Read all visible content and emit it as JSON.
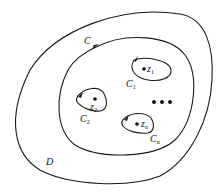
{
  "diagram": {
    "title": "",
    "region_label": "D",
    "outer_contour_label": "C",
    "inner_contours": [
      {
        "label": "C",
        "sub": "1",
        "point_label": "z",
        "point_sub": "1"
      },
      {
        "label": "C",
        "sub": "2",
        "point_label": "z",
        "point_sub": "2"
      },
      {
        "label": "C",
        "sub": "n",
        "point_label": "z",
        "point_sub": "n"
      }
    ],
    "ellipsis": "•••",
    "colors": {
      "stroke": "#1a1a1a",
      "background": "#ffffff"
    }
  }
}
